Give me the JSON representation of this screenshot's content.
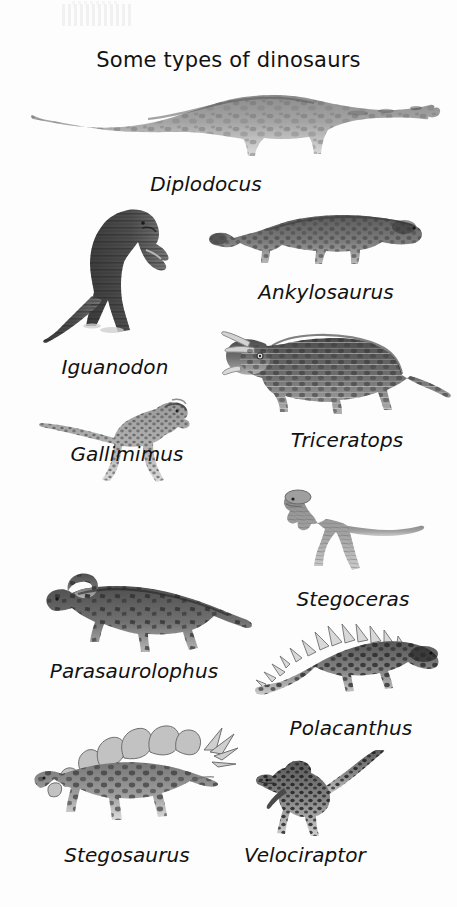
{
  "poster": {
    "title": "Some types of dinosaurs",
    "background_color": "#fdfdfd",
    "text_color": "#111111",
    "illustration_style": "grayscale photographic cut-outs of dinosaur models"
  },
  "dinosaurs": [
    {
      "id": "diplodocus",
      "label": "Diplodocus",
      "description": "long-necked long-tailed sauropod walking left, mottled grey",
      "label_center_x": 206,
      "label_baseline_y": 191
    },
    {
      "id": "iguanodon",
      "label": "Iguanodon",
      "description": "dark upright bipedal dinosaur facing right",
      "label_center_x": 115,
      "label_baseline_y": 374
    },
    {
      "id": "ankylosaurus",
      "label": "Ankylosaurus",
      "description": "low armoured quadruped with club tail, facing right",
      "label_center_x": 326,
      "label_baseline_y": 299
    },
    {
      "id": "triceratops",
      "label": "Triceratops",
      "description": "horned frilled quadruped facing left",
      "label_center_x": 347,
      "label_baseline_y": 447
    },
    {
      "id": "gallimimus",
      "label": "Gallimimus",
      "description": "slender light bipedal runner with long tail, facing right",
      "label_center_x": 127,
      "label_baseline_y": 461
    },
    {
      "id": "stegoceras",
      "label": "Stegoceras",
      "description": "small domed-head bipedal dinosaur facing left",
      "label_center_x": 353,
      "label_baseline_y": 606
    },
    {
      "id": "parasaurolophus",
      "label": "Parasaurolophus",
      "description": "crested hadrosaur facing left with long curved head crest",
      "label_center_x": 134,
      "label_baseline_y": 678
    },
    {
      "id": "polacanthus",
      "label": "Polacanthus",
      "description": "spiky-backed armoured quadruped facing right",
      "label_center_x": 351,
      "label_baseline_y": 735
    },
    {
      "id": "stegosaurus",
      "label": "Stegosaurus",
      "description": "plated quadruped with spiked tail, facing left",
      "label_center_x": 127,
      "label_baseline_y": 862
    },
    {
      "id": "velociraptor",
      "label": "Velociraptor",
      "description": "small slender raptor with stiff raised tail, facing left",
      "label_center_x": 305,
      "label_baseline_y": 862
    }
  ]
}
